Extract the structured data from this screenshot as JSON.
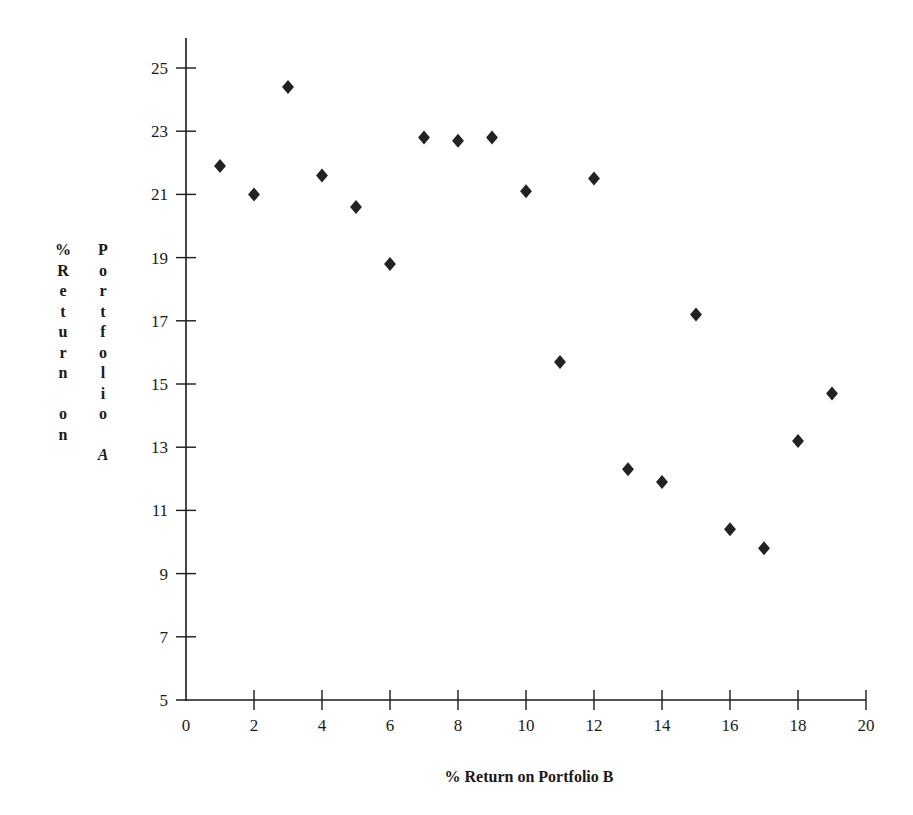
{
  "chart_data": {
    "type": "scatter",
    "title": "",
    "xlabel": "% Return on Portfolio B",
    "ylabel": "% Return on Portfolio A",
    "xlim": [
      0,
      20
    ],
    "ylim": [
      5,
      26
    ],
    "x_ticks": [
      0,
      2,
      4,
      6,
      8,
      10,
      12,
      14,
      16,
      18,
      20
    ],
    "y_ticks": [
      5,
      7,
      9,
      11,
      13,
      15,
      17,
      19,
      21,
      23,
      25
    ],
    "grid": false,
    "legend": null,
    "marker": "diamond",
    "marker_color": "#222222",
    "points": [
      {
        "x": 1,
        "y": 21.9
      },
      {
        "x": 2,
        "y": 21.0
      },
      {
        "x": 3,
        "y": 24.4
      },
      {
        "x": 4,
        "y": 21.6
      },
      {
        "x": 5,
        "y": 20.6
      },
      {
        "x": 6,
        "y": 18.8
      },
      {
        "x": 7,
        "y": 22.8
      },
      {
        "x": 8,
        "y": 22.7
      },
      {
        "x": 9,
        "y": 22.8
      },
      {
        "x": 10,
        "y": 21.1
      },
      {
        "x": 11,
        "y": 15.7
      },
      {
        "x": 12,
        "y": 21.5
      },
      {
        "x": 13,
        "y": 12.3
      },
      {
        "x": 14,
        "y": 11.9
      },
      {
        "x": 15,
        "y": 17.2
      },
      {
        "x": 16,
        "y": 10.4
      },
      {
        "x": 17,
        "y": 9.8
      },
      {
        "x": 18,
        "y": 13.2
      },
      {
        "x": 19,
        "y": 14.7
      }
    ]
  },
  "labels": {
    "x_axis_title": "% Return on Portfolio B",
    "y_axis_col1": [
      "%",
      "R",
      "e",
      "t",
      "u",
      "r",
      "n",
      "",
      "o",
      "n"
    ],
    "y_axis_col2": [
      "P",
      "o",
      "r",
      "t",
      "f",
      "o",
      "l",
      "i",
      "o",
      "",
      "A"
    ]
  }
}
